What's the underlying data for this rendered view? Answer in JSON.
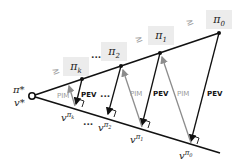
{
  "diagram": {
    "type": "policy-iteration-geometry",
    "optimal": {
      "policy_label": "π*",
      "value_label": "v*"
    },
    "policies": [
      {
        "label": "π",
        "sub": "k"
      },
      {
        "label": "π",
        "sub": "2"
      },
      {
        "label": "π",
        "sub": "1"
      },
      {
        "label": "π",
        "sub": "0"
      }
    ],
    "values": [
      {
        "label": "v",
        "sup": "π",
        "supsub": "k"
      },
      {
        "label": "v",
        "sup": "π",
        "supsub": "2"
      },
      {
        "label": "v",
        "sup": "π",
        "supsub": "1"
      },
      {
        "label": "v",
        "sup": "π",
        "supsub": "0"
      }
    ],
    "ordering_symbol": "≥",
    "ellipsis": "...",
    "step_labels": {
      "improvement": "PIM",
      "evaluation": "PEV"
    },
    "colors": {
      "line": "#111111",
      "pim_arrow": "#8c8c8c",
      "box": "#ececec"
    }
  }
}
